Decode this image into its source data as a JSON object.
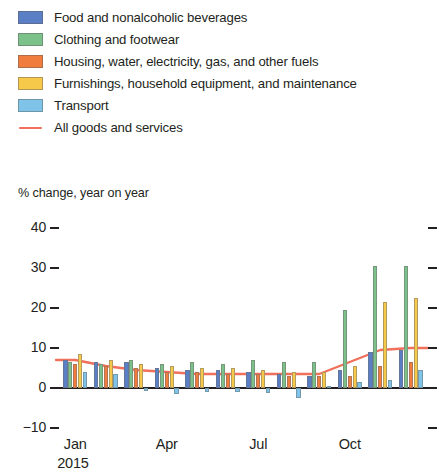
{
  "legend": {
    "items": [
      {
        "label": "Food and nonalcoholic beverages",
        "color": "#5b7fc4",
        "marker": "swatch"
      },
      {
        "label": "Clothing and footwear",
        "color": "#7cc08a",
        "marker": "swatch"
      },
      {
        "label": "Housing, water, electricity, gas, and other fuels",
        "color": "#f07c3e",
        "marker": "swatch"
      },
      {
        "label": "Furnishings, household equipment, and maintenance",
        "color": "#f7c94b",
        "marker": "swatch"
      },
      {
        "label": "Transport",
        "color": "#7fc3e8",
        "marker": "swatch"
      },
      {
        "label": "All goods and services",
        "color": "#f0705c",
        "marker": "line"
      }
    ]
  },
  "axis_title": "% change, year on year",
  "year_label": "2015",
  "chart_data": {
    "type": "bar",
    "title": "",
    "subtitle": "",
    "xlabel": "",
    "ylabel": "% change, year on year",
    "ylim": [
      -10,
      40
    ],
    "yticks": [
      40,
      30,
      20,
      10,
      0,
      -10
    ],
    "ytick_labels": [
      "40",
      "30",
      "20",
      "10",
      "0",
      "−10"
    ],
    "grid": false,
    "legend_position": "top",
    "categories": [
      "Jan",
      "Feb",
      "Mar",
      "Apr",
      "May",
      "Jun",
      "Jul",
      "Aug",
      "Sep",
      "Oct",
      "Nov",
      "Dec"
    ],
    "xtick_labels": [
      "Jan",
      "Apr",
      "Jul",
      "Oct"
    ],
    "xtick_positions": [
      0,
      3,
      6,
      9
    ],
    "series": [
      {
        "name": "Food and nonalcoholic beverages",
        "color": "#5b7fc4",
        "values": [
          7.0,
          6.5,
          6.5,
          5.0,
          4.5,
          4.5,
          4.0,
          3.5,
          3.0,
          4.5,
          9.0,
          9.5
        ]
      },
      {
        "name": "Clothing and footwear",
        "color": "#7cc08a",
        "values": [
          6.5,
          6.0,
          7.0,
          6.0,
          6.5,
          6.0,
          7.0,
          6.5,
          6.5,
          19.5,
          30.5,
          30.5
        ]
      },
      {
        "name": "Housing, water, electricity, gas, and other fuels",
        "color": "#f07c3e",
        "values": [
          6.0,
          5.5,
          5.0,
          4.0,
          4.0,
          3.5,
          3.5,
          3.0,
          3.0,
          3.0,
          5.5,
          6.5
        ]
      },
      {
        "name": "Furnishings, household equipment, and maintenance",
        "color": "#f7c94b",
        "values": [
          8.5,
          7.0,
          6.0,
          5.5,
          5.0,
          5.0,
          4.5,
          4.0,
          4.0,
          5.5,
          21.5,
          22.5
        ]
      },
      {
        "name": "Transport",
        "color": "#7fc3e8",
        "values": [
          4.0,
          3.5,
          -0.8,
          -1.5,
          -1.0,
          -1.0,
          -1.2,
          -2.5,
          0.5,
          1.5,
          2.0,
          4.5
        ]
      }
    ],
    "line_series": {
      "name": "All goods and services",
      "color": "#f0705c",
      "values": [
        7.0,
        5.5,
        4.5,
        4.0,
        3.5,
        3.5,
        3.5,
        3.5,
        3.5,
        6.5,
        9.5,
        10.0
      ]
    }
  }
}
